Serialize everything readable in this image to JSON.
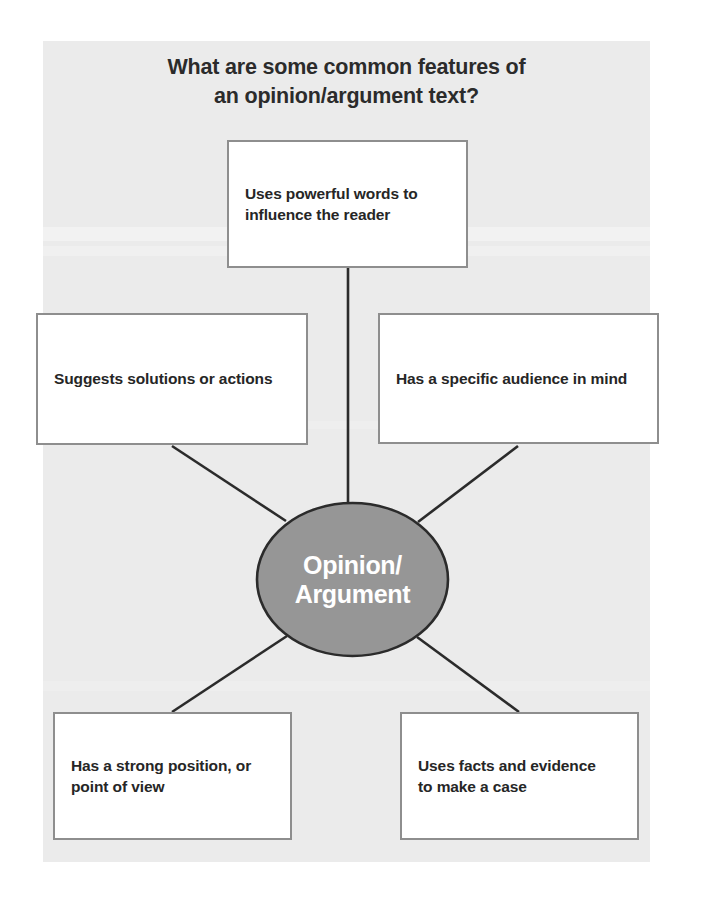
{
  "poster": {
    "background_color": "#ebebeb",
    "page_color": "#ffffff"
  },
  "title": {
    "line1": "What are some common features of",
    "line2": "an opinion/argument text?"
  },
  "center": {
    "label_line1": "Opinion/",
    "label_line2": "Argument",
    "fill_color": "#969696",
    "text_color": "#ffffff",
    "stroke_color": "#2b2b2b"
  },
  "boxes": {
    "top": {
      "line1": "Uses powerful words to",
      "line2": "influence the reader"
    },
    "left": {
      "line1": "Suggests solutions or actions",
      "line2": ""
    },
    "right": {
      "line1": "Has a specific audience in mind",
      "line2": ""
    },
    "bottom_left": {
      "line1": "Has a strong position, or",
      "line2": "point of view"
    },
    "bottom_right": {
      "line1": "Uses facts and evidence",
      "line2": "to make a case"
    }
  },
  "style": {
    "box_border_color": "#8e8e8e",
    "box_fill_color": "#ffffff",
    "connector_color": "#2b2b2b",
    "text_color": "#262626"
  }
}
